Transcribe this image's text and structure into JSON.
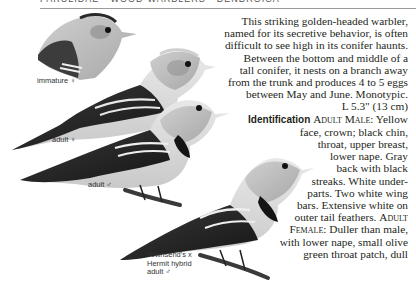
{
  "header": {
    "running_head": "PARULIDAE • WOOD-WARBLERS • DENDROICA"
  },
  "illustrations": {
    "labels": {
      "immature_female": "immature ♀",
      "adult_female": "adult ♀",
      "adult_male": "adult ♂",
      "hybrid_line1": "Townsend's x",
      "hybrid_line2": "Hermit hybrid",
      "hybrid_line3": "adult ♂"
    }
  },
  "body": {
    "intro_lines": [
      "This striking golden-headed warbler,",
      "named for its secretive behavior, is often",
      "difficult to see high in its conifer haunts.",
      "Between the bottom and middle of a",
      "tall conifer, it nests on a branch away",
      "from the trunk and produces 4 to 5 eggs",
      "between May and June. Monotypic.",
      "L 5.3\" (13 cm)"
    ],
    "identification": {
      "heading": "Identification",
      "adult_male_label": "Adult Male:",
      "lines": [
        "Yellow",
        "face, crown; black chin,",
        "throat, upper breast,",
        "lower nape. Gray",
        "back with black",
        "streaks. White under-",
        "parts. Two white wing",
        "bars. Extensive white on",
        "outer tail feathers."
      ],
      "adult_female_label_1": "Adult",
      "adult_female_label_2": "Female:",
      "female_lines": [
        "Duller than male,",
        "with lower nape, small olive",
        "green throat patch, dull"
      ]
    }
  },
  "colors": {
    "background": "#ffffff",
    "text": "#231f20",
    "rule": "#9a9a9a"
  }
}
